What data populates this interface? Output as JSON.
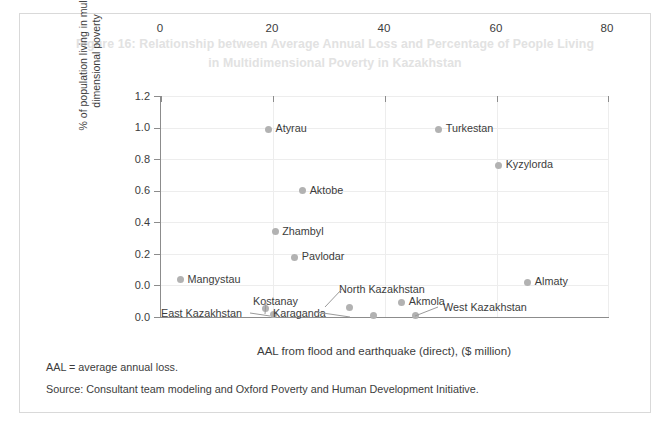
{
  "figure": {
    "title": "Figure 16: Relationship between Average Annual Loss and Percentage of People Living in Multidimensional Poverty in Kazakhstan",
    "notes": {
      "abbreviation": "AAL = average annual loss.",
      "source": "Source: Consultant team modeling and Oxford Poverty and Human Development Initiative."
    }
  },
  "colors": {
    "frame_border": "#d9d9d9",
    "title_text": "#e2e2e2",
    "axis_line": "#8c8c8c",
    "gridline": "#ededed",
    "marker": "#b2b2b2",
    "leader_line": "#9a9a9a",
    "text": "#3c3c3c"
  },
  "chart_data": {
    "type": "scatter",
    "title": "Figure 16: Relationship between Average Annual Loss and Percentage of People Living in Multidimensional Poverty in Kazakhstan",
    "xlabel": "AAL from flood and earthquake (direct), ($ million)",
    "ylabel": "% of population living in multi-dimensional poverty",
    "xlim": [
      0,
      80
    ],
    "ylim": [
      0.0,
      1.4
    ],
    "xticks": [
      "0",
      "20",
      "40",
      "60",
      "80"
    ],
    "yticks": [
      "0.0",
      "0.2",
      "0.4",
      "0.6",
      "0.8",
      "1.0",
      "1.2",
      "1.4"
    ],
    "grid": true,
    "legend": "none",
    "points": [
      {
        "label": "Atyrau",
        "x": 19.2,
        "y": 1.19,
        "label_pos": "right"
      },
      {
        "label": "Turkestan",
        "x": 49.6,
        "y": 1.19,
        "label_pos": "right"
      },
      {
        "label": "Kyzylorda",
        "x": 60.3,
        "y": 0.96,
        "label_pos": "right"
      },
      {
        "label": "Aktobe",
        "x": 25.3,
        "y": 0.8,
        "label_pos": "right"
      },
      {
        "label": "Zhambyl",
        "x": 20.4,
        "y": 0.54,
        "label_pos": "right"
      },
      {
        "label": "Pavlodar",
        "x": 23.9,
        "y": 0.38,
        "label_pos": "right"
      },
      {
        "label": "Mangystau",
        "x": 3.5,
        "y": 0.235,
        "label_pos": "right"
      },
      {
        "label": "Almaty",
        "x": 65.5,
        "y": 0.22,
        "label_pos": "right"
      },
      {
        "label": "Akmola",
        "x": 43.0,
        "y": 0.095,
        "label_pos": "right"
      },
      {
        "label": "North Kazakhstan",
        "x": 33.6,
        "y": 0.06,
        "label_pos": "leader"
      },
      {
        "label": "Kostanay",
        "x": 18.6,
        "y": 0.055,
        "label_pos": "leader"
      },
      {
        "label": "East Kazakhstan",
        "x": 20.0,
        "y": 0.015,
        "label_pos": "leader"
      },
      {
        "label": "Karaganda",
        "x": 38.0,
        "y": 0.01,
        "label_pos": "leader"
      },
      {
        "label": "West Kazakhstan",
        "x": 45.4,
        "y": 0.01,
        "label_pos": "leader"
      }
    ]
  }
}
